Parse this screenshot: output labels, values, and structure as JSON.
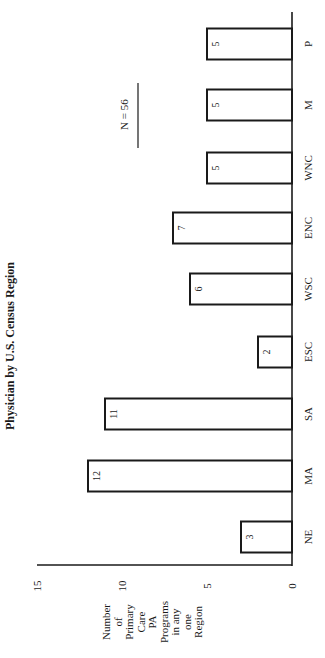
{
  "chart_data": {
    "type": "bar",
    "title": "Physician by U.S. Census Region",
    "xlabel": "",
    "ylabel": "Number of Primary Care PA Programs in any one Region",
    "ylabel_lines": [
      "Number",
      "of",
      "Primary",
      "Care",
      "PA",
      "Programs",
      "in any",
      "one",
      "Region"
    ],
    "categories": [
      "NE",
      "MA",
      "SA",
      "ESC",
      "WSC",
      "ENC",
      "WNC",
      "M",
      "P"
    ],
    "values": [
      3,
      12,
      11,
      2,
      6,
      7,
      5,
      5,
      5
    ],
    "data_labels": [
      "3",
      "12",
      "11",
      "2",
      "6",
      "7",
      "5",
      "5",
      "5"
    ],
    "ylim": [
      0,
      15
    ],
    "yticks": [
      "0",
      "5",
      "10",
      "15"
    ],
    "annotation": "N = 56",
    "grid": false,
    "legend": null,
    "orientation": "rotated 90° (page printed sideways)"
  }
}
